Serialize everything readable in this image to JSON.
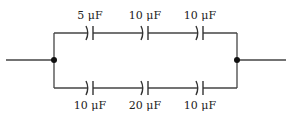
{
  "diagram": {
    "type": "capacitor network",
    "top_branch": {
      "capacitors": [
        {
          "label": "5 μF",
          "x": 90
        },
        {
          "label": "10 μF",
          "x": 145
        },
        {
          "label": "10 μF",
          "x": 200
        }
      ]
    },
    "bottom_branch": {
      "capacitors": [
        {
          "label": "10 μF",
          "x": 90
        },
        {
          "label": "20 μF",
          "x": 145
        },
        {
          "label": "10 μF",
          "x": 200
        }
      ]
    },
    "colors": {
      "wire": "#444444",
      "node": "#111111"
    }
  }
}
